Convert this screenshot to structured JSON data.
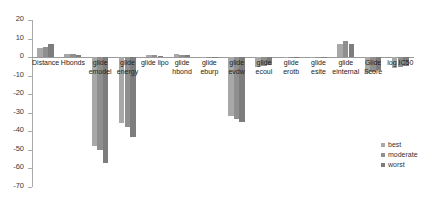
{
  "chart_data": {
    "type": "bar",
    "title": "",
    "xlabel": "",
    "ylabel": "",
    "ylim": [
      -70,
      20
    ],
    "ytick_step": 10,
    "grid": false,
    "legend_position": "bottom-right",
    "yticks": [
      "20",
      "10",
      "0",
      "-10",
      "-20",
      "-30",
      "-40",
      "-50",
      "-60",
      "-70"
    ],
    "categories": [
      "Distance",
      "Hbonds",
      "glide\nemodel",
      "glide\nenergy",
      "glide lipo",
      "glide\nhbond",
      "glide\neburp",
      "glide\nevdw",
      "glide\necoul",
      "glide\nerotb",
      "glide\nesite",
      "glide\neinternal",
      "Glide\nScore",
      "log IC50"
    ],
    "series": [
      {
        "name": "best",
        "color": "#a8a8a8",
        "values": [
          5.0,
          1.8,
          -48.0,
          -35.5,
          1.2,
          1.5,
          0.3,
          -31.5,
          -5.2,
          0.2,
          0.1,
          7.2,
          -8.5,
          -5.8
        ]
      },
      {
        "name": "moderate",
        "color": "#8f8f8f",
        "values": [
          5.2,
          1.9,
          -50.0,
          -37.5,
          1.0,
          1.3,
          0.2,
          -33.5,
          -4.8,
          0.2,
          0.1,
          8.5,
          -8.0,
          -5.2
        ]
      },
      {
        "name": "worst",
        "color": "#7d7d7d",
        "values": [
          7.0,
          0.9,
          -57.0,
          -43.0,
          0.8,
          1.1,
          0.2,
          -35.0,
          -4.2,
          0.1,
          0.1,
          7.0,
          -7.2,
          -4.6
        ]
      }
    ]
  },
  "legend": {
    "entries": [
      {
        "label": "best",
        "color": "#a8a8a8"
      },
      {
        "label": "moderate",
        "color": "#8f8f8f"
      },
      {
        "label": "worst",
        "color": "#7d7d7d"
      }
    ]
  }
}
